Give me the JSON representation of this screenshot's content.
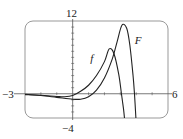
{
  "chart_data": {
    "type": "line",
    "title": "",
    "xlabel": "",
    "ylabel": "",
    "xlim": [
      -3,
      6
    ],
    "ylim": [
      -4,
      12
    ],
    "grid": false,
    "legend": "inline labels",
    "axis_labels": {
      "x_min": "−3",
      "x_max": "6",
      "y_max": "12",
      "y_min": "−4"
    },
    "x_ticks_every": 1,
    "y_ticks_every": 1,
    "series": [
      {
        "name": "f",
        "label": "f",
        "label_pos": [
          1.1,
          5.2
        ],
        "points": [
          [
            -3,
            -0.15
          ],
          [
            -2,
            -0.25
          ],
          [
            -1,
            -0.45
          ],
          [
            -0.5,
            -0.5
          ],
          [
            0,
            -0.3
          ],
          [
            0.5,
            0.4
          ],
          [
            1,
            1.4
          ],
          [
            1.5,
            3.0
          ],
          [
            2,
            5.3
          ],
          [
            2.3,
            7.4
          ],
          [
            2.6,
            6.6
          ],
          [
            2.9,
            3.2
          ],
          [
            3.07,
            0
          ],
          [
            3.2,
            -2.5
          ],
          [
            3.26,
            -4
          ]
        ]
      },
      {
        "name": "F",
        "label": "F",
        "label_pos": [
          3.9,
          8.2
        ],
        "points": [
          [
            -3,
            -0.1
          ],
          [
            -2,
            -0.3
          ],
          [
            -1,
            -0.6
          ],
          [
            0,
            -0.9
          ],
          [
            0.5,
            -0.9
          ],
          [
            1,
            -0.5
          ],
          [
            1.5,
            0.6
          ],
          [
            2,
            2.6
          ],
          [
            2.5,
            5.8
          ],
          [
            2.8,
            8.6
          ],
          [
            3.1,
            11.3
          ],
          [
            3.4,
            10.8
          ],
          [
            3.6,
            8.0
          ],
          [
            3.8,
            3.0
          ],
          [
            3.89,
            0
          ],
          [
            3.98,
            -4
          ]
        ]
      }
    ]
  },
  "colors": {
    "curve": "#222222",
    "axis": "#555555",
    "frame": "#999999"
  }
}
